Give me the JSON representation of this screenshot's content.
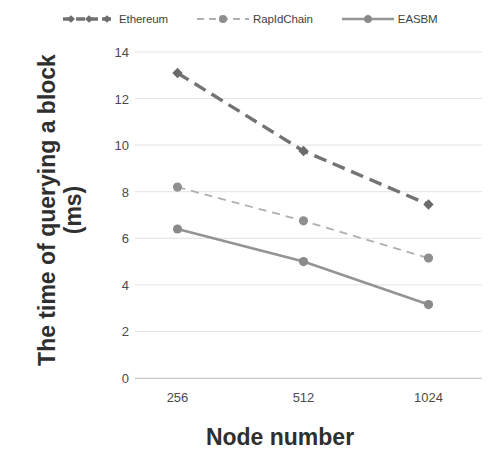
{
  "chart_data": {
    "type": "line",
    "title": "",
    "xlabel": "Node number",
    "ylabel": "The time of querying a block (ms)",
    "ylabel_lines": [
      "The time of querying a block",
      "(ms)"
    ],
    "categories": [
      "256",
      "512",
      "1024"
    ],
    "yticks": [
      0,
      2,
      4,
      6,
      8,
      10,
      12,
      14
    ],
    "ylim": [
      0,
      14
    ],
    "grid": true,
    "legend_position": "top",
    "series": [
      {
        "name": "Ethereum",
        "values": [
          13.1,
          9.75,
          7.45
        ],
        "color": "#737373",
        "style": "dashed",
        "width": 3.4,
        "marker": "diamond"
      },
      {
        "name": "RapIdChain",
        "values": [
          8.2,
          6.75,
          5.15
        ],
        "color": "#b0b0b0",
        "style": "dashed",
        "width": 1.8,
        "marker": "circle"
      },
      {
        "name": "EASBM",
        "values": [
          6.4,
          5.0,
          3.15
        ],
        "color": "#949494",
        "style": "solid",
        "width": 2.6,
        "marker": "circle"
      }
    ]
  }
}
